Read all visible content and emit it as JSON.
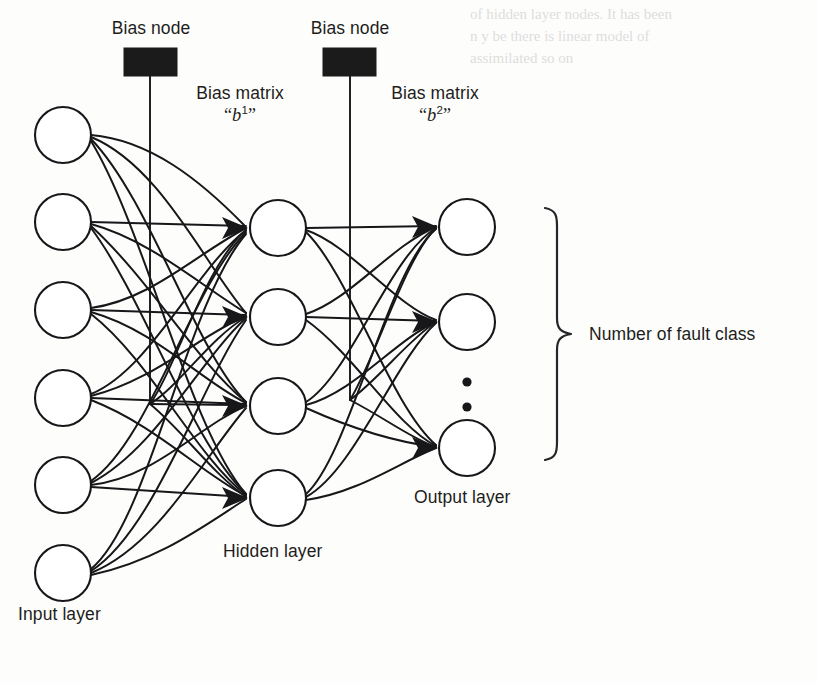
{
  "figure": {
    "type": "neural-network-architecture",
    "background_color": "#fdfdfc",
    "stroke_color": "#17171a",
    "bias_node_color": "#1b1b1b"
  },
  "labels": {
    "bias_node_1": "Bias node",
    "bias_node_2": "Bias node",
    "bias_matrix_1_line1": "Bias matrix",
    "bias_matrix_1_symbol": "b",
    "bias_matrix_1_superscript": "1",
    "bias_matrix_2_line1": "Bias matrix",
    "bias_matrix_2_symbol": "b",
    "bias_matrix_2_superscript": "2",
    "open_quote": "“",
    "close_quote": "”",
    "input_layer": "Input layer",
    "hidden_layer": "Hidden layer",
    "output_layer": "Output layer",
    "fault_class": "Number of fault class"
  },
  "network": {
    "layers": [
      {
        "name": "input",
        "label": "Input layer",
        "node_count": 6,
        "cx": 63,
        "radius": 28,
        "node_cy": [
          135,
          222,
          310,
          398,
          485,
          573
        ],
        "ellipsis": false
      },
      {
        "name": "hidden",
        "label": "Hidden layer",
        "node_count": 4,
        "cx": 278,
        "radius": 28,
        "node_cy": [
          228,
          317,
          406,
          498
        ],
        "ellipsis": false
      },
      {
        "name": "output",
        "label": "Output layer",
        "node_count": 3,
        "cx": 467,
        "radius": 28,
        "node_cy": [
          227,
          322,
          448
        ],
        "ellipsis": true,
        "ellipsis_dots_cy": [
          382,
          407
        ],
        "ellipsis_cx": 467
      }
    ],
    "bias_nodes": [
      {
        "id": "b1",
        "label": "Bias node",
        "rect": {
          "x": 124,
          "y": 48,
          "width": 53,
          "height": 28
        },
        "stem_x": 150,
        "stem_from_y": 76,
        "stem_to_y": 404,
        "targets_layer": "hidden"
      },
      {
        "id": "b2",
        "label": "Bias node",
        "rect": {
          "x": 323,
          "y": 48,
          "width": 53,
          "height": 28
        },
        "stem_x": 350,
        "stem_from_y": 76,
        "stem_to_y": 400,
        "targets_layer": "output"
      }
    ],
    "brace": {
      "label": "Number of fault class",
      "x": 553,
      "top_y": 208,
      "bottom_y": 460,
      "mid_y": 334,
      "tip_x": 573
    }
  },
  "ghost_text": [
    {
      "text": "of hidden layer nodes. It has been",
      "x": 470,
      "y": 14
    },
    {
      "text": "n y be there is linear model of",
      "x": 470,
      "y": 36
    },
    {
      "text": "assimilated so on",
      "x": 470,
      "y": 58
    }
  ]
}
